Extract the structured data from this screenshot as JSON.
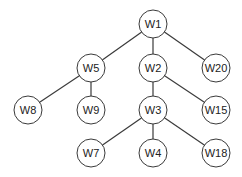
{
  "diagram": {
    "type": "tree",
    "root": "W1",
    "node_radius": 14,
    "nodes": [
      {
        "id": "W1",
        "label": "W1",
        "x": 153,
        "y": 24
      },
      {
        "id": "W5",
        "label": "W5",
        "x": 91,
        "y": 68
      },
      {
        "id": "W2",
        "label": "W2",
        "x": 153,
        "y": 68
      },
      {
        "id": "W20",
        "label": "W20",
        "x": 216,
        "y": 68
      },
      {
        "id": "W8",
        "label": "W8",
        "x": 28,
        "y": 110
      },
      {
        "id": "W9",
        "label": "W9",
        "x": 91,
        "y": 110
      },
      {
        "id": "W3",
        "label": "W3",
        "x": 153,
        "y": 110
      },
      {
        "id": "W15",
        "label": "W15",
        "x": 216,
        "y": 110
      },
      {
        "id": "W7",
        "label": "W7",
        "x": 91,
        "y": 153
      },
      {
        "id": "W4",
        "label": "W4",
        "x": 153,
        "y": 153
      },
      {
        "id": "W18",
        "label": "W18",
        "x": 216,
        "y": 153
      }
    ],
    "edges": [
      {
        "from": "W1",
        "to": "W5"
      },
      {
        "from": "W1",
        "to": "W2"
      },
      {
        "from": "W1",
        "to": "W20"
      },
      {
        "from": "W5",
        "to": "W8"
      },
      {
        "from": "W5",
        "to": "W9"
      },
      {
        "from": "W2",
        "to": "W3"
      },
      {
        "from": "W2",
        "to": "W15"
      },
      {
        "from": "W3",
        "to": "W7"
      },
      {
        "from": "W3",
        "to": "W4"
      },
      {
        "from": "W3",
        "to": "W18"
      }
    ]
  }
}
